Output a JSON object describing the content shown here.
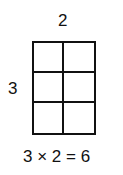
{
  "diagram": {
    "columns_label": "2",
    "rows_label": "3",
    "equation": "3 × 2 = 6",
    "rows": 3,
    "columns": 2
  }
}
